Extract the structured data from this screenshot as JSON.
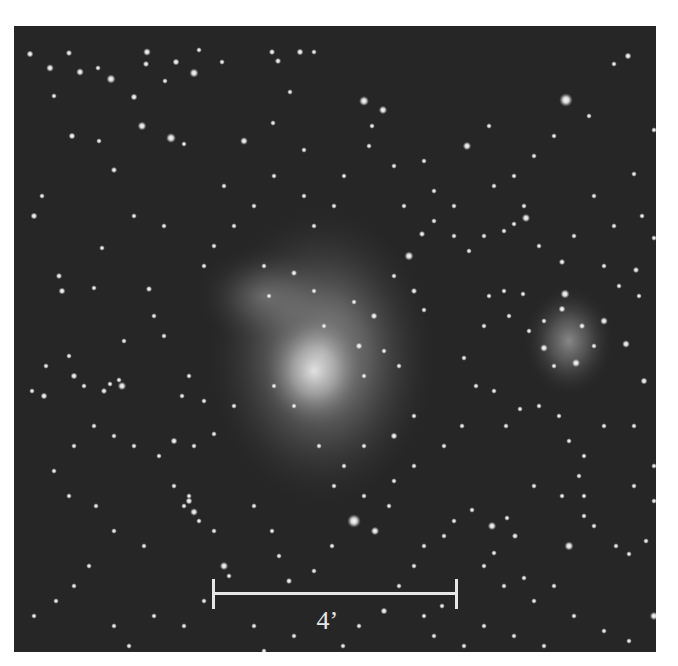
{
  "image": {
    "subject": "nebula-star-field",
    "background_color": "#262626",
    "frame": {
      "x": 14,
      "y": 26,
      "width": 642,
      "height": 626
    }
  },
  "scale_bar": {
    "label": "4’",
    "color": "#e6e6e6",
    "x1": 199,
    "x2": 442,
    "y": 568,
    "tick_half": 15
  },
  "nebulae": [
    {
      "cx": 308,
      "cy": 330,
      "rx": 115,
      "ry": 150,
      "opacity": 0.55
    },
    {
      "cx": 300,
      "cy": 345,
      "rx": 55,
      "ry": 60,
      "opacity": 0.75
    },
    {
      "cx": 250,
      "cy": 270,
      "rx": 70,
      "ry": 50,
      "opacity": 0.25
    },
    {
      "cx": 555,
      "cy": 315,
      "rx": 45,
      "ry": 55,
      "opacity": 0.45
    }
  ],
  "stars": [
    [
      16,
      28,
      2
    ],
    [
      36,
      42,
      2.2
    ],
    [
      40,
      70,
      1.6
    ],
    [
      55,
      27,
      1.8
    ],
    [
      58,
      110,
      2
    ],
    [
      66,
      46,
      2.2
    ],
    [
      84,
      42,
      1.6
    ],
    [
      97,
      53,
      2.6
    ],
    [
      100,
      144,
      1.8
    ],
    [
      120,
      71,
      2
    ],
    [
      133,
      26,
      2.2
    ],
    [
      132,
      38,
      1.8
    ],
    [
      151,
      55,
      1.6
    ],
    [
      157,
      112,
      2.8
    ],
    [
      162,
      36,
      2
    ],
    [
      128,
      100,
      2.5
    ],
    [
      170,
      118,
      1.6
    ],
    [
      180,
      47,
      2.6
    ],
    [
      185,
      24,
      1.6
    ],
    [
      208,
      36,
      1.6
    ],
    [
      230,
      115,
      2.2
    ],
    [
      259,
      97,
      1.6
    ],
    [
      258,
      26,
      1.8
    ],
    [
      264,
      35,
      1.8
    ],
    [
      276,
      66,
      1.6
    ],
    [
      286,
      26,
      2
    ],
    [
      290,
      124,
      1.6
    ],
    [
      300,
      26,
      1.6
    ],
    [
      20,
      190,
      2
    ],
    [
      28,
      170,
      1.6
    ],
    [
      48,
      265,
      2
    ],
    [
      85,
      115,
      1.6
    ],
    [
      45,
      250,
      1.8
    ],
    [
      80,
      262,
      1.6
    ],
    [
      88,
      222,
      1.6
    ],
    [
      135,
      263,
      1.8
    ],
    [
      350,
      75,
      2.8
    ],
    [
      369,
      84,
      2.4
    ],
    [
      358,
      100,
      1.6
    ],
    [
      380,
      140,
      1.6
    ],
    [
      390,
      180,
      1.6
    ],
    [
      410,
      135,
      1.6
    ],
    [
      453,
      120,
      2.4
    ],
    [
      475,
      100,
      1.6
    ],
    [
      510,
      180,
      1.6
    ],
    [
      540,
      110,
      1.6
    ],
    [
      552,
      74,
      3.8
    ],
    [
      575,
      90,
      1.6
    ],
    [
      600,
      38,
      1.6
    ],
    [
      614,
      30,
      2
    ],
    [
      620,
      148,
      1.6
    ],
    [
      628,
      190,
      1.6
    ],
    [
      640,
      104,
      1.6
    ],
    [
      355,
      120,
      1.6
    ],
    [
      395,
      230,
      2.6
    ],
    [
      408,
      208,
      1.8
    ],
    [
      380,
      250,
      1.6
    ],
    [
      400,
      265,
      1.8
    ],
    [
      410,
      284,
      1.6
    ],
    [
      360,
      290,
      2
    ],
    [
      340,
      276,
      1.6
    ],
    [
      300,
      265,
      1.6
    ],
    [
      280,
      247,
      1.8
    ],
    [
      255,
      270,
      1.6
    ],
    [
      310,
      300,
      1.6
    ],
    [
      345,
      320,
      2
    ],
    [
      370,
      325,
      1.6
    ],
    [
      385,
      340,
      1.6
    ],
    [
      350,
      350,
      1.6
    ],
    [
      420,
      195,
      1.6
    ],
    [
      440,
      210,
      1.6
    ],
    [
      455,
      225,
      1.6
    ],
    [
      470,
      210,
      1.6
    ],
    [
      490,
      205,
      1.6
    ],
    [
      500,
      198,
      1.6
    ],
    [
      512,
      192,
      2.4
    ],
    [
      525,
      220,
      1.6
    ],
    [
      548,
      236,
      1.8
    ],
    [
      551,
      268,
      2.6
    ],
    [
      548,
      283,
      2
    ],
    [
      530,
      295,
      1.6
    ],
    [
      568,
      300,
      1.8
    ],
    [
      590,
      295,
      2.2
    ],
    [
      612,
      318,
      2.2
    ],
    [
      622,
      244,
      1.8
    ],
    [
      640,
      212,
      1.6
    ],
    [
      630,
      355,
      2
    ],
    [
      645,
      378,
      1.6
    ],
    [
      475,
      270,
      1.6
    ],
    [
      490,
      265,
      1.6
    ],
    [
      509,
      268,
      1.6
    ],
    [
      495,
      290,
      1.6
    ],
    [
      515,
      305,
      1.6
    ],
    [
      530,
      322,
      2.2
    ],
    [
      540,
      340,
      1.6
    ],
    [
      562,
      337,
      2.4
    ],
    [
      580,
      320,
      1.6
    ],
    [
      470,
      300,
      1.6
    ],
    [
      450,
      332,
      1.6
    ],
    [
      462,
      360,
      1.6
    ],
    [
      480,
      365,
      1.6
    ],
    [
      492,
      400,
      1.6
    ],
    [
      506,
      383,
      1.6
    ],
    [
      525,
      380,
      1.6
    ],
    [
      545,
      390,
      1.6
    ],
    [
      555,
      415,
      1.6
    ],
    [
      570,
      430,
      1.6
    ],
    [
      590,
      400,
      1.6
    ],
    [
      620,
      400,
      1.6
    ],
    [
      640,
      440,
      1.6
    ],
    [
      448,
      400,
      1.6
    ],
    [
      430,
      420,
      1.6
    ],
    [
      400,
      390,
      1.6
    ],
    [
      380,
      410,
      2
    ],
    [
      350,
      420,
      1.6
    ],
    [
      330,
      440,
      1.6
    ],
    [
      305,
      420,
      1.6
    ],
    [
      280,
      380,
      1.6
    ],
    [
      260,
      360,
      1.6
    ],
    [
      220,
      380,
      1.6
    ],
    [
      200,
      408,
      1.6
    ],
    [
      180,
      420,
      1.6
    ],
    [
      160,
      415,
      2
    ],
    [
      145,
      430,
      1.6
    ],
    [
      120,
      420,
      1.6
    ],
    [
      100,
      410,
      1.6
    ],
    [
      90,
      365,
      1.8
    ],
    [
      96,
      358,
      1.6
    ],
    [
      70,
      360,
      1.6
    ],
    [
      60,
      350,
      2
    ],
    [
      30,
      370,
      2
    ],
    [
      18,
      365,
      1.6
    ],
    [
      55,
      330,
      1.6
    ],
    [
      32,
      340,
      1.6
    ],
    [
      110,
      315,
      1.6
    ],
    [
      140,
      290,
      1.6
    ],
    [
      150,
      310,
      1.6
    ],
    [
      168,
      370,
      1.6
    ],
    [
      175,
      350,
      1.6
    ],
    [
      190,
      375,
      1.6
    ],
    [
      108,
      360,
      2.4
    ],
    [
      105,
      354,
      1.6
    ],
    [
      80,
      400,
      1.6
    ],
    [
      60,
      420,
      1.6
    ],
    [
      40,
      445,
      1.6
    ],
    [
      55,
      470,
      1.6
    ],
    [
      82,
      480,
      1.6
    ],
    [
      100,
      505,
      1.6
    ],
    [
      130,
      520,
      1.6
    ],
    [
      160,
      460,
      1.6
    ],
    [
      170,
      480,
      1.6
    ],
    [
      175,
      475,
      2
    ],
    [
      180,
      486,
      2.2
    ],
    [
      185,
      495,
      1.6
    ],
    [
      200,
      505,
      1.6
    ],
    [
      215,
      550,
      1.6
    ],
    [
      210,
      540,
      2.4
    ],
    [
      175,
      470,
      1.6
    ],
    [
      240,
      480,
      1.6
    ],
    [
      258,
      505,
      1.6
    ],
    [
      265,
      530,
      1.6
    ],
    [
      275,
      555,
      1.8
    ],
    [
      300,
      545,
      1.6
    ],
    [
      318,
      520,
      1.6
    ],
    [
      340,
      495,
      3.8
    ],
    [
      361,
      505,
      2.4
    ],
    [
      350,
      470,
      1.6
    ],
    [
      375,
      480,
      1.6
    ],
    [
      380,
      455,
      1.6
    ],
    [
      400,
      440,
      1.6
    ],
    [
      320,
      460,
      1.6
    ],
    [
      20,
      590,
      1.6
    ],
    [
      42,
      575,
      1.6
    ],
    [
      60,
      560,
      1.6
    ],
    [
      75,
      540,
      1.6
    ],
    [
      100,
      600,
      1.6
    ],
    [
      115,
      620,
      1.6
    ],
    [
      140,
      590,
      1.6
    ],
    [
      170,
      600,
      1.6
    ],
    [
      190,
      575,
      1.6
    ],
    [
      240,
      600,
      1.6
    ],
    [
      250,
      625,
      1.6
    ],
    [
      280,
      610,
      1.6
    ],
    [
      329,
      620,
      1.6
    ],
    [
      345,
      600,
      1.6
    ],
    [
      370,
      585,
      2
    ],
    [
      385,
      560,
      1.6
    ],
    [
      400,
      540,
      1.6
    ],
    [
      410,
      520,
      1.6
    ],
    [
      430,
      510,
      1.6
    ],
    [
      440,
      495,
      1.6
    ],
    [
      458,
      484,
      1.6
    ],
    [
      478,
      500,
      2.4
    ],
    [
      493,
      492,
      1.6
    ],
    [
      501,
      510,
      1.8
    ],
    [
      480,
      527,
      1.6
    ],
    [
      470,
      540,
      1.6
    ],
    [
      490,
      560,
      1.6
    ],
    [
      510,
      552,
      1.6
    ],
    [
      520,
      575,
      1.6
    ],
    [
      540,
      560,
      1.6
    ],
    [
      555,
      520,
      2.6
    ],
    [
      570,
      490,
      1.6
    ],
    [
      580,
      500,
      1.6
    ],
    [
      602,
      520,
      1.6
    ],
    [
      615,
      528,
      1.6
    ],
    [
      632,
      515,
      1.6
    ],
    [
      570,
      470,
      1.6
    ],
    [
      565,
      450,
      1.6
    ],
    [
      548,
      470,
      1.6
    ],
    [
      520,
      460,
      1.6
    ],
    [
      620,
      460,
      1.6
    ],
    [
      640,
      475,
      1.6
    ],
    [
      640,
      590,
      2.4
    ],
    [
      615,
      615,
      1.6
    ],
    [
      590,
      605,
      1.6
    ],
    [
      560,
      590,
      1.6
    ],
    [
      530,
      620,
      1.6
    ],
    [
      500,
      610,
      1.6
    ],
    [
      470,
      600,
      1.6
    ],
    [
      450,
      620,
      1.6
    ],
    [
      420,
      610,
      1.6
    ],
    [
      410,
      590,
      1.6
    ],
    [
      428,
      580,
      1.6
    ],
    [
      200,
      220,
      1.6
    ],
    [
      220,
      200,
      1.6
    ],
    [
      240,
      180,
      1.6
    ],
    [
      210,
      160,
      1.6
    ],
    [
      260,
      150,
      1.6
    ],
    [
      290,
      170,
      1.6
    ],
    [
      300,
      200,
      1.6
    ],
    [
      320,
      180,
      1.6
    ],
    [
      330,
      150,
      1.6
    ],
    [
      250,
      240,
      1.6
    ],
    [
      190,
      240,
      1.6
    ],
    [
      150,
      200,
      1.6
    ],
    [
      120,
      190,
      1.6
    ],
    [
      420,
      165,
      1.6
    ],
    [
      440,
      180,
      1.6
    ],
    [
      480,
      160,
      1.6
    ],
    [
      500,
      150,
      1.6
    ],
    [
      520,
      130,
      1.6
    ],
    [
      580,
      170,
      1.6
    ],
    [
      600,
      200,
      1.6
    ],
    [
      560,
      210,
      1.6
    ],
    [
      590,
      240,
      1.6
    ],
    [
      625,
      270,
      1.6
    ],
    [
      605,
      260,
      1.6
    ]
  ]
}
